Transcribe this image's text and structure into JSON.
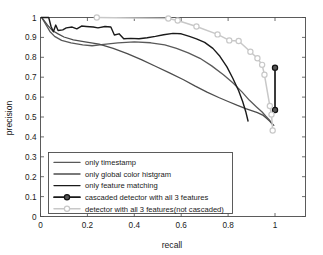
{
  "chart_data": {
    "type": "line",
    "title": "",
    "xlabel": "recall",
    "ylabel": "precision",
    "xlim": [
      0,
      1.13
    ],
    "ylim": [
      0,
      1
    ],
    "grid": false,
    "legend_position": "lower-left",
    "xticks": [
      "0",
      "0.2",
      "0.4",
      "0.6",
      "0.8",
      "1"
    ],
    "xtick_values": [
      0,
      0.2,
      0.4,
      0.6,
      0.8,
      1
    ],
    "yticks": [
      "0",
      "0.1",
      "0.2",
      "0.3",
      "0.4",
      "0.5",
      "0.6",
      "0.7",
      "0.8",
      "0.9",
      "1"
    ],
    "ytick_values": [
      0,
      0.1,
      0.2,
      0.3,
      0.4,
      0.5,
      0.6,
      0.7,
      0.8,
      0.9,
      1
    ],
    "series": [
      {
        "name": "only timestamp",
        "color": "#595959",
        "width": 1.3,
        "marker": "none",
        "points": [
          [
            0.005,
            1.0
          ],
          [
            0.02,
            0.97
          ],
          [
            0.04,
            0.93
          ],
          [
            0.06,
            0.905
          ],
          [
            0.09,
            0.885
          ],
          [
            0.13,
            0.872
          ],
          [
            0.18,
            0.862
          ],
          [
            0.22,
            0.858
          ],
          [
            0.27,
            0.865
          ],
          [
            0.33,
            0.872
          ],
          [
            0.4,
            0.878
          ],
          [
            0.47,
            0.873
          ],
          [
            0.53,
            0.862
          ],
          [
            0.58,
            0.845
          ],
          [
            0.63,
            0.822
          ],
          [
            0.68,
            0.795
          ],
          [
            0.73,
            0.757
          ],
          [
            0.78,
            0.712
          ],
          [
            0.82,
            0.672
          ],
          [
            0.86,
            0.625
          ],
          [
            0.89,
            0.585
          ],
          [
            0.92,
            0.552
          ],
          [
            0.945,
            0.525
          ],
          [
            0.96,
            0.505
          ],
          [
            0.975,
            0.487
          ],
          [
            0.985,
            0.47
          ],
          [
            0.995,
            0.458
          ]
        ]
      },
      {
        "name": "only global color histgram",
        "color": "#4d4d4d",
        "width": 1.3,
        "marker": "none",
        "points": [
          [
            0.005,
            1.0
          ],
          [
            0.03,
            0.962
          ],
          [
            0.05,
            0.935
          ],
          [
            0.075,
            0.918
          ],
          [
            0.1,
            0.902
          ],
          [
            0.14,
            0.888
          ],
          [
            0.19,
            0.878
          ],
          [
            0.25,
            0.866
          ],
          [
            0.31,
            0.845
          ],
          [
            0.37,
            0.818
          ],
          [
            0.43,
            0.788
          ],
          [
            0.49,
            0.755
          ],
          [
            0.55,
            0.722
          ],
          [
            0.61,
            0.687
          ],
          [
            0.66,
            0.655
          ],
          [
            0.71,
            0.625
          ],
          [
            0.76,
            0.598
          ],
          [
            0.8,
            0.578
          ],
          [
            0.84,
            0.558
          ],
          [
            0.875,
            0.542
          ],
          [
            0.9,
            0.532
          ],
          [
            0.925,
            0.522
          ],
          [
            0.95,
            0.508
          ],
          [
            0.965,
            0.492
          ],
          [
            0.978,
            0.478
          ],
          [
            0.99,
            0.462
          ]
        ]
      },
      {
        "name": "only feature matching",
        "color": "#1a1a1a",
        "width": 1.4,
        "marker": "none",
        "points": [
          [
            0.005,
            1.0
          ],
          [
            0.035,
            1.0
          ],
          [
            0.045,
            0.955
          ],
          [
            0.055,
            0.928
          ],
          [
            0.065,
            0.962
          ],
          [
            0.075,
            0.935
          ],
          [
            0.095,
            0.938
          ],
          [
            0.11,
            0.948
          ],
          [
            0.135,
            0.952
          ],
          [
            0.155,
            0.943
          ],
          [
            0.175,
            0.957
          ],
          [
            0.195,
            0.955
          ],
          [
            0.225,
            0.952
          ],
          [
            0.245,
            0.948
          ],
          [
            0.275,
            0.955
          ],
          [
            0.3,
            0.952
          ],
          [
            0.315,
            0.912
          ],
          [
            0.335,
            0.918
          ],
          [
            0.355,
            0.893
          ],
          [
            0.385,
            0.895
          ],
          [
            0.42,
            0.893
          ],
          [
            0.455,
            0.898
          ],
          [
            0.49,
            0.905
          ],
          [
            0.525,
            0.913
          ],
          [
            0.565,
            0.92
          ],
          [
            0.6,
            0.918
          ],
          [
            0.635,
            0.905
          ],
          [
            0.665,
            0.893
          ],
          [
            0.7,
            0.875
          ],
          [
            0.735,
            0.845
          ],
          [
            0.765,
            0.805
          ],
          [
            0.795,
            0.752
          ],
          [
            0.82,
            0.695
          ],
          [
            0.845,
            0.632
          ],
          [
            0.862,
            0.578
          ],
          [
            0.875,
            0.528
          ],
          [
            0.885,
            0.48
          ]
        ]
      },
      {
        "name": "cascaded detector with all 3 features",
        "color": "#1a1a1a",
        "width": 1.7,
        "marker": "circle-filled",
        "marker_color": "#333333",
        "points": [
          [
            1.0,
            0.748
          ],
          [
            1.0,
            0.535
          ]
        ]
      },
      {
        "name": "detector with all 3 features(not cascaded)",
        "color": "#c8c8c8",
        "width": 1.5,
        "marker": "circle-open",
        "marker_color": "#c8c8c8",
        "points": [
          [
            0.24,
            1.0
          ],
          [
            0.545,
            0.995
          ],
          [
            0.585,
            0.985
          ],
          [
            0.665,
            0.955
          ],
          [
            0.755,
            0.915
          ],
          [
            0.805,
            0.885
          ],
          [
            0.845,
            0.882
          ],
          [
            0.895,
            0.828
          ],
          [
            0.925,
            0.795
          ],
          [
            0.945,
            0.762
          ],
          [
            0.955,
            0.712
          ],
          [
            0.978,
            0.555
          ],
          [
            0.985,
            0.512
          ],
          [
            0.99,
            0.432
          ]
        ]
      }
    ]
  },
  "legend": {
    "entries": [
      {
        "label": "only timestamp",
        "color": "#595959",
        "marker": "none"
      },
      {
        "label": "only global color histgram",
        "color": "#4d4d4d",
        "marker": "none"
      },
      {
        "label": "only feature matching",
        "color": "#1a1a1a",
        "marker": "none"
      },
      {
        "label": "cascaded detector with all 3 features",
        "color": "#1a1a1a",
        "marker": "circle-filled"
      },
      {
        "label": "detector with all 3 features(not cascaded)",
        "color": "#c8c8c8",
        "marker": "circle-open"
      }
    ]
  }
}
